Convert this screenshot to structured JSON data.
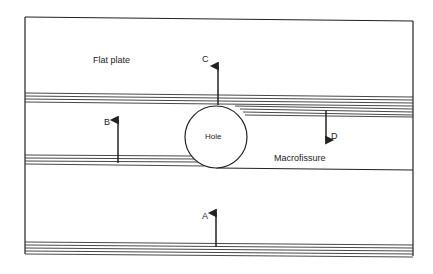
{
  "diagram": {
    "labels": {
      "plate": "Flat plate",
      "hole": "Hole",
      "fissure": "Macrofissure",
      "arrow_a": "A",
      "arrow_b": "B",
      "arrow_c": "C",
      "arrow_d": "D"
    },
    "colors": {
      "line": "#222222",
      "background": "#ffffff"
    }
  }
}
